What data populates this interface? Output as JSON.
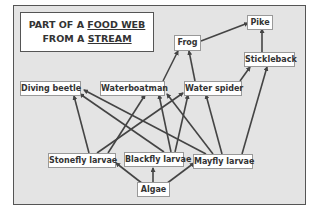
{
  "title": {
    "line1_prefix": "PART OF A ",
    "line1_emph": "FOOD WEB",
    "line2_prefix": "FROM A ",
    "line2_emph": "STREAM"
  },
  "nodes": {
    "pike": "Pike",
    "frog": "Frog",
    "stickleback": "Stickleback",
    "diving_beetle": "Diving beetle",
    "waterboatman": "Waterboatman",
    "water_spider": "Water spider",
    "stonefly_larvae": "Stonefly larvae",
    "blackfly_larvae": "Blackfly larvae",
    "mayfly_larvae": "Mayfly larvae",
    "algae": "Algae"
  },
  "edges": [
    {
      "from": "Algae",
      "to": "Stonefly larvae"
    },
    {
      "from": "Algae",
      "to": "Blackfly larvae"
    },
    {
      "from": "Algae",
      "to": "Mayfly larvae"
    },
    {
      "from": "Stonefly larvae",
      "to": "Diving beetle"
    },
    {
      "from": "Stonefly larvae",
      "to": "Waterboatman"
    },
    {
      "from": "Stonefly larvae",
      "to": "Water spider"
    },
    {
      "from": "Blackfly larvae",
      "to": "Diving beetle"
    },
    {
      "from": "Blackfly larvae",
      "to": "Waterboatman"
    },
    {
      "from": "Blackfly larvae",
      "to": "Water spider"
    },
    {
      "from": "Mayfly larvae",
      "to": "Diving beetle"
    },
    {
      "from": "Mayfly larvae",
      "to": "Waterboatman"
    },
    {
      "from": "Mayfly larvae",
      "to": "Water spider"
    },
    {
      "from": "Mayfly larvae",
      "to": "Stickleback"
    },
    {
      "from": "Waterboatman",
      "to": "Frog"
    },
    {
      "from": "Water spider",
      "to": "Frog"
    },
    {
      "from": "Water spider",
      "to": "Stickleback"
    },
    {
      "from": "Frog",
      "to": "Pike"
    },
    {
      "from": "Stickleback",
      "to": "Pike"
    }
  ],
  "colors": {
    "panel_bg": "#e4e4e4",
    "arrow": "#444444",
    "node_bg": "#ffffff"
  }
}
